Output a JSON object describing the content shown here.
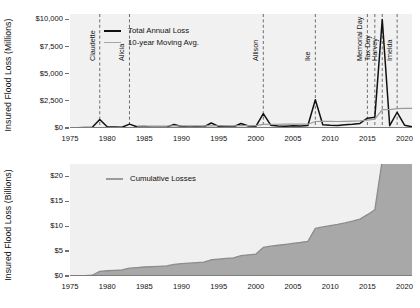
{
  "chart_data": [
    {
      "type": "line",
      "id": "annual-losses",
      "title": "",
      "xlabel": "",
      "ylabel": "Insured Flood Loss (Millions)",
      "xlim": [
        1975,
        2021
      ],
      "ylim": [
        0,
        10500
      ],
      "grid": false,
      "legend_position": "top-left",
      "ytick_labels": [
        "$0",
        "$2,500",
        "$5,000",
        "$7,500",
        "$10,000"
      ],
      "ytick_values": [
        0,
        2500,
        5000,
        7500,
        10000
      ],
      "xtick_labels": [
        "1975",
        "1980",
        "1985",
        "1990",
        "1995",
        "2000",
        "2005",
        "2010",
        "2015",
        "2020"
      ],
      "xtick_values": [
        1975,
        1980,
        1985,
        1990,
        1995,
        2000,
        2005,
        2010,
        2015,
        2020
      ],
      "x": [
        1975,
        1976,
        1977,
        1978,
        1979,
        1980,
        1981,
        1982,
        1983,
        1984,
        1985,
        1986,
        1987,
        1988,
        1989,
        1990,
        1991,
        1992,
        1993,
        1994,
        1995,
        1996,
        1997,
        1998,
        1999,
        2000,
        2001,
        2002,
        2003,
        2004,
        2005,
        2006,
        2007,
        2008,
        2009,
        2010,
        2011,
        2012,
        2013,
        2014,
        2015,
        2016,
        2017,
        2018,
        2019,
        2020,
        2021
      ],
      "series": [
        {
          "name": "Total Annual Loss",
          "color": "#111111",
          "values": [
            20,
            30,
            40,
            60,
            780,
            120,
            90,
            70,
            360,
            110,
            130,
            70,
            60,
            80,
            330,
            140,
            90,
            120,
            100,
            460,
            150,
            130,
            120,
            420,
            180,
            150,
            1320,
            260,
            190,
            170,
            200,
            180,
            230,
            2600,
            300,
            260,
            240,
            300,
            340,
            420,
            900,
            980,
            10000,
            210,
            1450,
            260,
            120
          ]
        },
        {
          "name": "10-year Moving Avg.",
          "color": "#9a9a9a",
          "values": [
            null,
            null,
            null,
            null,
            null,
            null,
            null,
            null,
            null,
            170,
            180,
            180,
            180,
            185,
            200,
            200,
            195,
            190,
            190,
            200,
            205,
            200,
            195,
            215,
            220,
            215,
            330,
            345,
            345,
            350,
            355,
            350,
            350,
            600,
            615,
            610,
            600,
            615,
            630,
            650,
            720,
            810,
            1700,
            1700,
            1790,
            1800,
            1810
          ]
        }
      ],
      "event_markers": [
        {
          "label": "Claudette",
          "year": 1979
        },
        {
          "label": "Alicia",
          "year": 1983
        },
        {
          "label": "Allison",
          "year": 2001
        },
        {
          "label": "Ike",
          "year": 2008
        },
        {
          "label": "Memorial Day",
          "year": 2015
        },
        {
          "label": "Tax Day",
          "year": 2016
        },
        {
          "label": "Harvey",
          "year": 2017
        },
        {
          "label": "Imelda",
          "year": 2019
        }
      ]
    },
    {
      "type": "area",
      "id": "cumulative-losses",
      "title": "",
      "xlabel": "",
      "ylabel": "Insured Flood Loss (Billions)",
      "xlim": [
        1975,
        2021
      ],
      "ylim": [
        0,
        22.5
      ],
      "grid": false,
      "legend_position": "top-left",
      "ytick_labels": [
        "$0",
        "$5",
        "$10",
        "$15",
        "$20"
      ],
      "ytick_values": [
        0,
        5,
        10,
        15,
        20
      ],
      "xtick_labels": [
        "1975",
        "1980",
        "1985",
        "1990",
        "1995",
        "2000",
        "2005",
        "2010",
        "2015",
        "2020"
      ],
      "xtick_values": [
        1975,
        1980,
        1985,
        1990,
        1995,
        2000,
        2005,
        2010,
        2015,
        2020
      ],
      "x": [
        1975,
        1976,
        1977,
        1978,
        1979,
        1980,
        1981,
        1982,
        1983,
        1984,
        1985,
        1986,
        1987,
        1988,
        1989,
        1990,
        1991,
        1992,
        1993,
        1994,
        1995,
        1996,
        1997,
        1998,
        1999,
        2000,
        2001,
        2002,
        2003,
        2004,
        2005,
        2006,
        2007,
        2008,
        2009,
        2010,
        2011,
        2012,
        2013,
        2014,
        2015,
        2016,
        2017,
        2018,
        2019,
        2020,
        2021
      ],
      "series": [
        {
          "name": "Cumulative Losses",
          "color": "#a8a8a8",
          "values": [
            0.02,
            0.05,
            0.09,
            0.15,
            0.93,
            1.05,
            1.14,
            1.21,
            1.57,
            1.68,
            1.81,
            1.88,
            1.94,
            2.02,
            2.35,
            2.49,
            2.58,
            2.7,
            2.8,
            3.26,
            3.41,
            3.54,
            3.66,
            4.08,
            4.26,
            4.41,
            5.73,
            5.99,
            6.18,
            6.35,
            6.55,
            6.73,
            6.96,
            9.56,
            9.86,
            10.12,
            10.36,
            10.66,
            11.0,
            11.42,
            12.32,
            13.3,
            23.3,
            23.51,
            24.96,
            25.22,
            25.34
          ]
        }
      ]
    }
  ],
  "panels": {
    "top": {
      "ylabel": "Insured Flood Loss (Millions)",
      "legend": [
        {
          "label": "Total Annual Loss",
          "style": "annual"
        },
        {
          "label": "10-year Moving Avg.",
          "style": "mavg"
        }
      ]
    },
    "bottom": {
      "ylabel": "Insured Flood Loss (Billions)",
      "legend": [
        {
          "label": "Cumulative Losses",
          "style": "cum"
        }
      ]
    }
  }
}
